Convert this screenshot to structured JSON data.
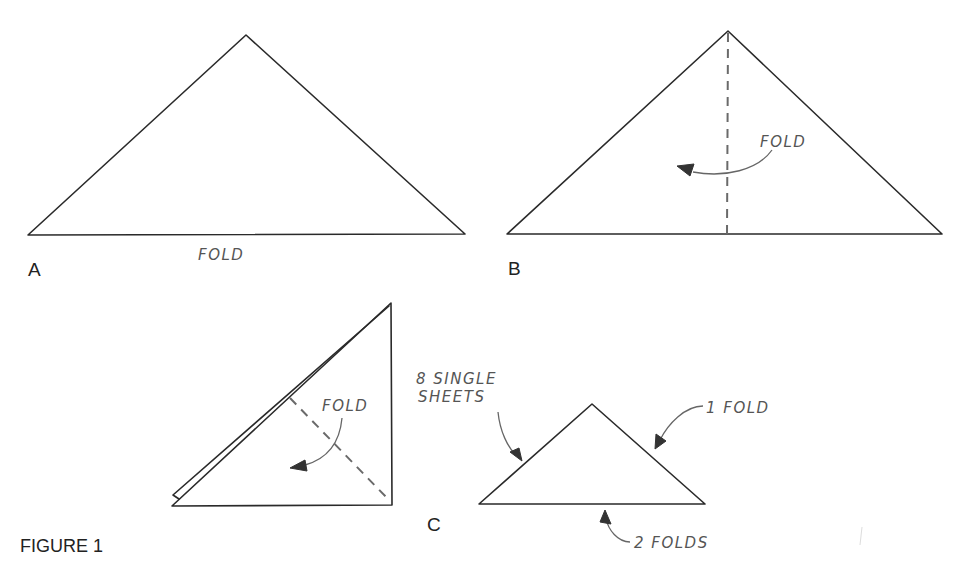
{
  "figure": {
    "title": "FIGURE 1",
    "panels": [
      {
        "id": "A",
        "label": "A",
        "annotations": [
          "FOLD"
        ]
      },
      {
        "id": "B",
        "label": "B",
        "annotations": [
          "FOLD"
        ]
      },
      {
        "id": "C",
        "label": "C",
        "annotations": [
          "FOLD",
          "8 SINGLE",
          "SHEETS",
          "1 FOLD",
          "2 FOLDS"
        ]
      }
    ]
  },
  "panelA": {
    "label": "A",
    "fold_text": "FOLD"
  },
  "panelB": {
    "label": "B",
    "fold_text": "FOLD"
  },
  "panelC": {
    "label": "C",
    "fold_text": "FOLD",
    "single_sheets_line1": "8 SINGLE",
    "single_sheets_line2": "SHEETS",
    "one_fold": "1 FOLD",
    "two_folds": "2 FOLDS"
  },
  "colors": {
    "ink": "#2a2a2a",
    "annotation": "#555555",
    "background": "#ffffff"
  }
}
